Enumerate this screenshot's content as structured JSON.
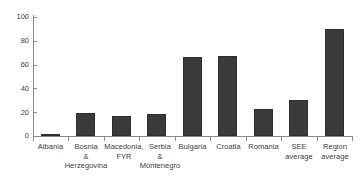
{
  "chart_data": {
    "type": "bar",
    "title": "",
    "subtitle": "",
    "xlabel": "",
    "ylabel": "",
    "ylim": [
      0,
      100
    ],
    "yticks": [
      0,
      20,
      40,
      60,
      80,
      100
    ],
    "grid": false,
    "legend": false,
    "legend_position": "none",
    "bar_color": "#3a3a3a",
    "axis_color": "#8a8a8a",
    "categories": [
      "Albania",
      "Bosnia\n&\nHerzegovina",
      "Macedonia,\nFYR",
      "Serbia\n&\nMontenegro",
      "Bulgaria",
      "Croatia",
      "Romania",
      "SEE\naverage",
      "Region\naverage"
    ],
    "values": [
      1.2,
      19,
      17,
      18.5,
      66.5,
      67.5,
      22.5,
      30,
      90
    ]
  }
}
